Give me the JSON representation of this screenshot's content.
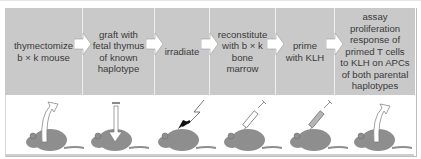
{
  "figure": {
    "steps": [
      {
        "label": "thymectomize\nb × k mouse",
        "width": 78
      },
      {
        "label": "graft with\nfetal thymus\nof known\nhaplotype",
        "width": 72
      },
      {
        "label": "irradiate",
        "width": 55
      },
      {
        "label": "reconstitute\nwith b × k\nbone\nmarrow",
        "width": 66
      },
      {
        "label": "prime\nwith KLH",
        "width": 59
      },
      {
        "label": "assay\nproliferation\nresponse of\nprimed T cells\nto KLH on APCs\nof both parental\nhaplotypes",
        "width": 80
      }
    ],
    "mice": [
      {
        "icon": "mouse-thymus-removal-arrow-icon",
        "symbol": "arrow-out"
      },
      {
        "icon": "mouse-thymus-graft-arrow-icon",
        "symbol": "arrow-in"
      },
      {
        "icon": "mouse-irradiation-lightning-icon",
        "symbol": "lightning"
      },
      {
        "icon": "mouse-bone-marrow-syringe-icon",
        "symbol": "syringe"
      },
      {
        "icon": "mouse-klh-syringe-icon",
        "symbol": "syringe"
      },
      {
        "icon": "mouse-cell-harvest-arrow-icon",
        "symbol": "arrow-out"
      }
    ],
    "colors": {
      "box": "#c9c9c9",
      "text": "#3a3a3a",
      "mouse": "#8e8e8e",
      "arrow_fill": "#ffffff",
      "arrow_stroke": "#9a9a9a"
    }
  }
}
